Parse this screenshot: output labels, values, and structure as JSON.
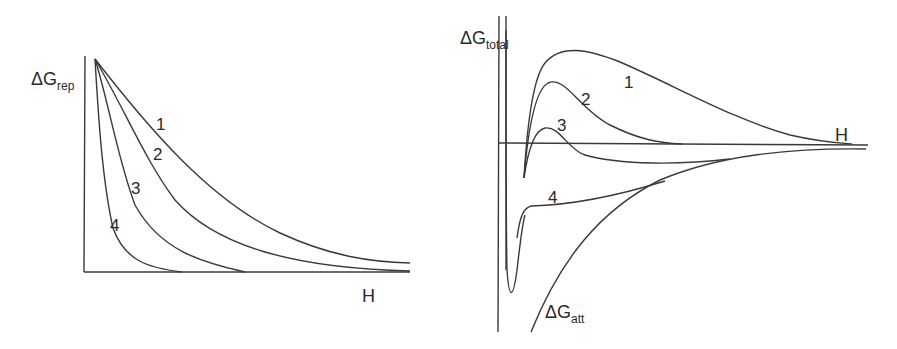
{
  "left_panel": {
    "y_axis_label": {
      "main": "ΔG",
      "sub": "rep"
    },
    "x_axis_label": "H",
    "curve_labels": [
      "1",
      "2",
      "3",
      "4"
    ]
  },
  "right_panel": {
    "y_axis_label": {
      "main": "ΔG",
      "sub": "total"
    },
    "x_axis_label": "H",
    "curve_labels": [
      "1",
      "2",
      "3",
      "4"
    ],
    "attraction_label": {
      "main": "ΔG",
      "sub": "att"
    }
  },
  "colors": {
    "line": "#3a3a3a",
    "text": "#2a2a2a",
    "background": "#ffffff"
  }
}
